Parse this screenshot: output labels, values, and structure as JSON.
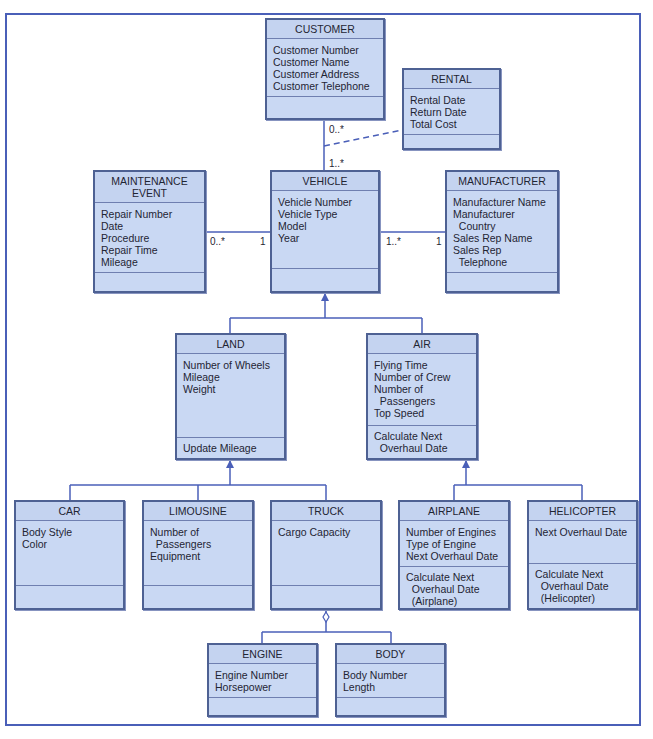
{
  "classes": {
    "customer": {
      "name": "CUSTOMER",
      "attributes": [
        "Customer Number",
        "Customer Name",
        "Customer Address",
        "Customer Telephone"
      ],
      "operations": []
    },
    "rental": {
      "name": "RENTAL",
      "attributes": [
        "Rental Date",
        "Return Date",
        "Total Cost"
      ],
      "operations": []
    },
    "maintenance": {
      "name": "MAINTENANCE\nEVENT",
      "attributes": [
        "Repair Number",
        "Date",
        "Procedure",
        "Repair Time",
        "Mileage"
      ],
      "operations": []
    },
    "vehicle": {
      "name": "VEHICLE",
      "attributes": [
        "Vehicle Number",
        "Vehicle Type",
        "Model",
        "Year"
      ],
      "operations": []
    },
    "manufacturer": {
      "name": "MANUFACTURER",
      "attributes": [
        "Manufacturer Name",
        "Manufacturer",
        "  Country",
        "Sales Rep Name",
        "Sales Rep",
        "  Telephone"
      ],
      "operations": []
    },
    "land": {
      "name": "LAND",
      "attributes": [
        "Number of Wheels",
        "Mileage",
        "Weight"
      ],
      "operations": [
        "Update Mileage"
      ]
    },
    "air": {
      "name": "AIR",
      "attributes": [
        "Flying Time",
        "Number of Crew",
        "Number of",
        "  Passengers",
        "Top Speed"
      ],
      "operations": [
        "Calculate Next",
        "  Overhaul Date"
      ]
    },
    "car": {
      "name": "CAR",
      "attributes": [
        "Body Style",
        "Color"
      ],
      "operations": []
    },
    "limousine": {
      "name": "LIMOUSINE",
      "attributes": [
        "Number of",
        "  Passengers",
        "Equipment"
      ],
      "operations": []
    },
    "truck": {
      "name": "TRUCK",
      "attributes": [
        "Cargo Capacity"
      ],
      "operations": []
    },
    "airplane": {
      "name": "AIRPLANE",
      "attributes": [
        "Number of Engines",
        "Type of Engine",
        "Next Overhaul Date"
      ],
      "operations": [
        "Calculate Next",
        "  Overhaul Date",
        "  (Airplane)"
      ]
    },
    "helicopter": {
      "name": "HELICOPTER",
      "attributes": [
        "Next Overhaul Date"
      ],
      "operations": [
        "Calculate Next",
        "  Overhaul Date",
        "  (Helicopter)"
      ]
    },
    "engine": {
      "name": "ENGINE",
      "attributes": [
        "Engine Number",
        "Horsepower"
      ],
      "operations": []
    },
    "body": {
      "name": "BODY",
      "attributes": [
        "Body Number",
        "Length"
      ],
      "operations": []
    }
  },
  "multiplicities": {
    "customer_vehicle_top": "0..*",
    "customer_vehicle_bottom": "1..*",
    "maintenance_left": "0..*",
    "maintenance_right": "1",
    "manufacturer_left": "1..*",
    "manufacturer_right": "1"
  },
  "colors": {
    "box_fill": "#c9d8f3",
    "box_border": "#4e6193",
    "line": "#4a5fb8"
  }
}
